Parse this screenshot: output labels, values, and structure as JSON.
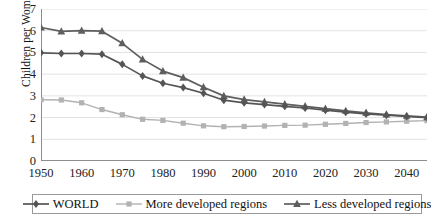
{
  "chart_data": {
    "type": "line",
    "title": "",
    "xlabel": "",
    "ylabel": "Children per Woman",
    "xlim": [
      1950,
      2045
    ],
    "ylim": [
      0,
      7
    ],
    "ytick_values": [
      0,
      1,
      2,
      3,
      4,
      5,
      6,
      7
    ],
    "ytick_labels": [
      "0",
      "1",
      "2",
      "3",
      "4",
      "5",
      "6",
      "7"
    ],
    "xtick_values": [
      1950,
      1960,
      1970,
      1980,
      1990,
      2000,
      2010,
      2020,
      2030,
      2040
    ],
    "xtick_labels": [
      "1950",
      "1960",
      "1970",
      "1980",
      "1990",
      "2000",
      "2010",
      "2020",
      "2030",
      "2040"
    ],
    "grid": "horizontal",
    "legend_position": "bottom",
    "x": [
      1950,
      1955,
      1960,
      1965,
      1970,
      1975,
      1980,
      1985,
      1990,
      1995,
      2000,
      2005,
      2010,
      2015,
      2020,
      2025,
      2030,
      2035,
      2040,
      2045
    ],
    "series": [
      {
        "name": "WORLD",
        "marker": "diamond",
        "color": "#555555",
        "values": [
          4.98,
          4.95,
          4.95,
          4.92,
          4.45,
          3.92,
          3.58,
          3.38,
          3.12,
          2.8,
          2.68,
          2.6,
          2.52,
          2.44,
          2.34,
          2.25,
          2.17,
          2.11,
          2.05,
          2.0
        ]
      },
      {
        "name": "More developed regions",
        "marker": "square",
        "color": "#b2b2b2",
        "values": [
          2.82,
          2.81,
          2.68,
          2.37,
          2.13,
          1.92,
          1.87,
          1.74,
          1.62,
          1.58,
          1.59,
          1.61,
          1.64,
          1.65,
          1.69,
          1.73,
          1.77,
          1.8,
          1.83,
          1.86
        ]
      },
      {
        "name": "Less developed regions",
        "marker": "triangle",
        "color": "#5e5e5e",
        "values": [
          6.15,
          5.97,
          6.0,
          5.98,
          5.42,
          4.68,
          4.14,
          3.84,
          3.4,
          3.0,
          2.83,
          2.72,
          2.62,
          2.52,
          2.41,
          2.31,
          2.22,
          2.14,
          2.08,
          2.02
        ]
      }
    ]
  },
  "axis": {
    "y_title": "Children per Woman"
  },
  "legend": {
    "entries": [
      {
        "label": "WORLD"
      },
      {
        "label": "More developed regions"
      },
      {
        "label": "Less developed regions"
      }
    ]
  },
  "colors": {
    "world": "#555555",
    "more_developed": "#b2b2b2",
    "less_developed": "#5e5e5e",
    "grid": "#e2e2e2",
    "axis": "#8d8d8d",
    "text": "#111111"
  }
}
